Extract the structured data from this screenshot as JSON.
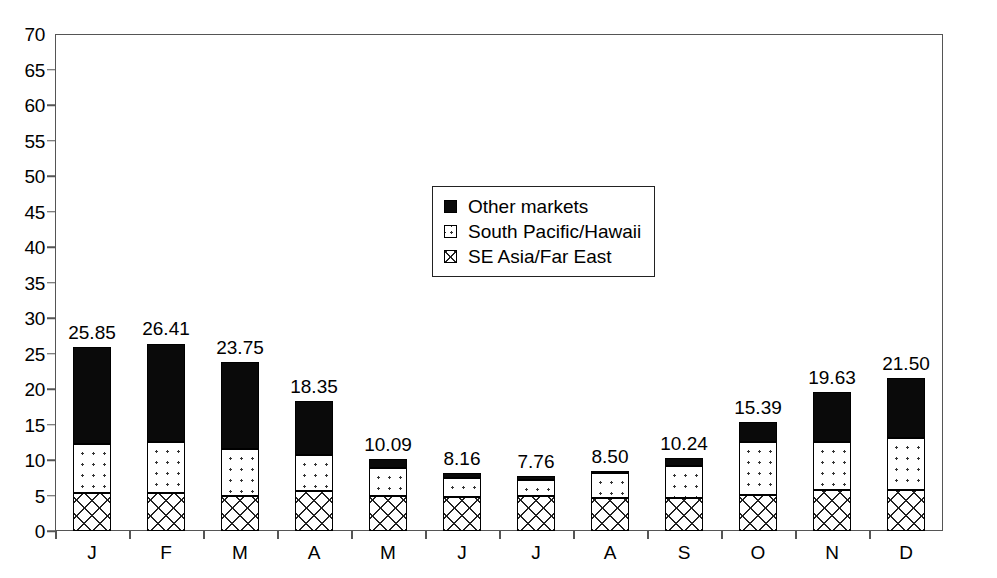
{
  "chart_data": {
    "type": "bar",
    "subtype": "stacked",
    "title": "",
    "xlabel": "",
    "ylabel": "",
    "ylim": [
      0,
      70
    ],
    "ytick_step": 5,
    "yticks": [
      "70",
      "65",
      "60",
      "55",
      "50",
      "45",
      "40",
      "35",
      "30",
      "25",
      "20",
      "15",
      "10",
      "5",
      "0"
    ],
    "grid": false,
    "legend_position": "upper-center",
    "categories": [
      "J",
      "F",
      "M",
      "A",
      "M",
      "J",
      "J",
      "A",
      "S",
      "O",
      "N",
      "D"
    ],
    "series": [
      {
        "name": "SE Asia/Far East",
        "key": "se",
        "values": [
          5.35,
          5.3,
          4.9,
          5.7,
          4.9,
          4.8,
          4.9,
          4.7,
          4.7,
          5.1,
          5.8,
          5.8
        ]
      },
      {
        "name": "South Pacific/Hawaii",
        "key": "south",
        "values": [
          6.9,
          7.2,
          6.6,
          5.0,
          4.0,
          2.7,
          2.3,
          3.5,
          4.5,
          7.4,
          6.7,
          7.3
        ]
      },
      {
        "name": "Other markets",
        "key": "other",
        "values": [
          13.6,
          13.91,
          12.25,
          7.65,
          1.19,
          0.66,
          0.56,
          0.3,
          1.04,
          2.89,
          7.13,
          8.4
        ]
      }
    ],
    "totals": [
      25.85,
      26.41,
      23.75,
      18.35,
      10.09,
      8.16,
      7.76,
      8.5,
      10.24,
      15.39,
      19.63,
      21.5
    ],
    "total_labels": [
      "25.85",
      "26.41",
      "23.75",
      "18.35",
      "10.09",
      "8.16",
      "7.76",
      "8.50",
      "10.24",
      "15.39",
      "19.63",
      "21.50"
    ],
    "colors": {
      "other": "#0a0a0a",
      "south": "#ffffff",
      "se": "#ffffff",
      "outline": "#000000",
      "axis": "#555555",
      "background": "#ffffff"
    }
  },
  "legend": {
    "items": [
      {
        "label": "Other markets",
        "key": "other"
      },
      {
        "label": "South Pacific/Hawaii",
        "key": "south"
      },
      {
        "label": "SE Asia/Far East",
        "key": "se"
      }
    ]
  }
}
